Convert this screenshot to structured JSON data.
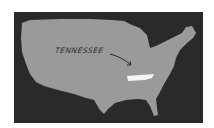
{
  "map": {
    "region": "United States",
    "highlighted_state": "Tennessee",
    "label": "TENNESSEE",
    "colors": {
      "background": "#2a2a2a",
      "land": "#9a9a9a",
      "highlight": "#f4f4f4",
      "label": "#2b2b2b"
    }
  }
}
